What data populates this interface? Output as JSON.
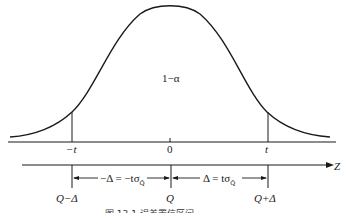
{
  "diagram": {
    "type": "normal-distribution-confidence-interval",
    "area_label": "1−α",
    "t_axis": {
      "left_label": "−t",
      "center_label": "0",
      "right_label": "t"
    },
    "z_axis": {
      "label": "Z"
    },
    "q_axis": {
      "left_label": "Q−Δ",
      "center_label": "Q",
      "right_label": "Q+Δ"
    },
    "dimensions": {
      "left_prefix": "−Δ = −tσ",
      "left_subscript": "Q̂",
      "right_prefix": "Δ = tσ",
      "right_subscript": "Q̂"
    },
    "caption": "图 13.1   误差置信区间"
  },
  "colors": {
    "stroke": "#1a1a1a",
    "background": "#ffffff"
  }
}
